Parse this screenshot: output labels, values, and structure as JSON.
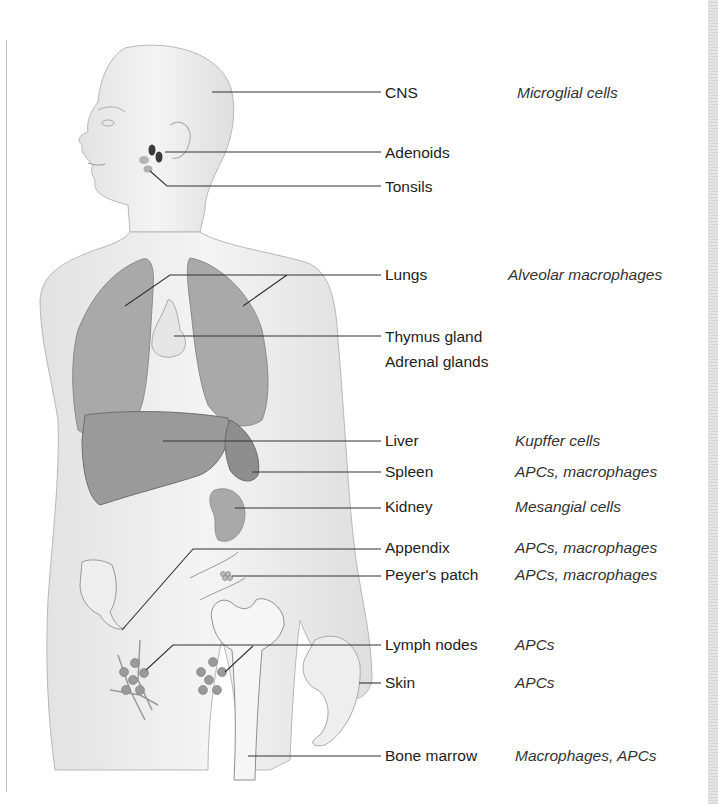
{
  "diagram": {
    "structures": [
      {
        "id": "cns",
        "label": "CNS",
        "cells": "Microglial cells",
        "y": 93,
        "desc_x": 517
      },
      {
        "id": "adenoids",
        "label": "Adenoids",
        "cells": "",
        "y": 153
      },
      {
        "id": "tonsils",
        "label": "Tonsils",
        "cells": "",
        "y": 187
      },
      {
        "id": "lungs",
        "label": "Lungs",
        "cells": "Alveolar macrophages",
        "y": 275,
        "desc_x": 508
      },
      {
        "id": "thymus",
        "label": "Thymus gland",
        "cells": "",
        "y": 338
      },
      {
        "id": "adrenal",
        "label": "Adrenal glands",
        "cells": "",
        "y": 362
      },
      {
        "id": "liver",
        "label": "Liver",
        "cells": "Kupffer cells",
        "y": 441,
        "desc_x": 515
      },
      {
        "id": "spleen",
        "label": "Spleen",
        "cells": "APCs, macrophages",
        "y": 472,
        "desc_x": 515
      },
      {
        "id": "kidney",
        "label": "Kidney",
        "cells": "Mesangial cells",
        "y": 507,
        "desc_x": 515
      },
      {
        "id": "appendix",
        "label": "Appendix",
        "cells": "APCs, macrophages",
        "y": 548,
        "desc_x": 515
      },
      {
        "id": "peyers",
        "label": "Peyer's patch",
        "cells": "APCs, macrophages",
        "y": 575,
        "desc_x": 515
      },
      {
        "id": "lymph",
        "label": "Lymph nodes",
        "cells": "APCs",
        "y": 646,
        "desc_x": 515
      },
      {
        "id": "skin",
        "label": "Skin",
        "cells": "APCs",
        "y": 683,
        "desc_x": 515
      },
      {
        "id": "marrow",
        "label": "Bone marrow",
        "cells": "Macrophages, APCs",
        "y": 756,
        "desc_x": 515
      }
    ],
    "colors": {
      "skin": "#efefef",
      "organ": "#a9a9a9",
      "organ_dark": "#8e8e8e",
      "line": "#333333",
      "node_dark": "#3a3a3a",
      "node_light": "#b5b5b5"
    }
  }
}
